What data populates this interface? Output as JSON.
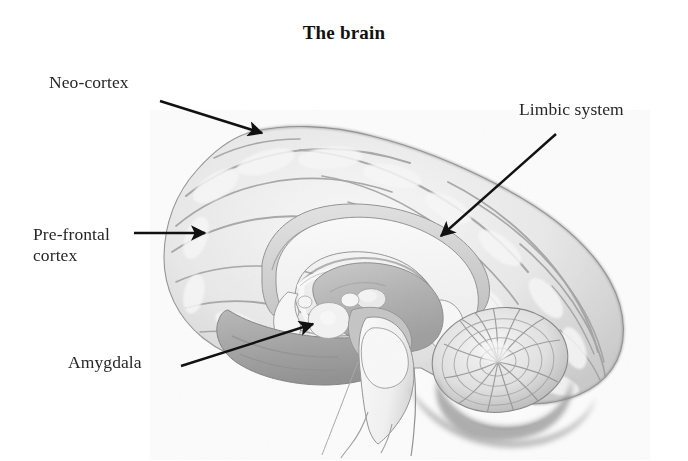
{
  "figure": {
    "title": "The brain",
    "background_color": "#ffffff",
    "ink_color": "#262626"
  },
  "annotations": [
    {
      "id": "neocortex",
      "label": "Neo-cortex",
      "label_pos": {
        "x": 49,
        "y": 72
      },
      "arrow": {
        "x1": 160,
        "y1": 101,
        "x2": 262,
        "y2": 133
      }
    },
    {
      "id": "limbic-system",
      "label": "Limbic system",
      "label_pos": {
        "x": 519,
        "y": 99
      },
      "arrow": {
        "x1": 556,
        "y1": 134,
        "x2": 441,
        "y2": 236
      }
    },
    {
      "id": "pre-frontal-cortex",
      "label": "Pre-frontal\ncortex",
      "label_pos": {
        "x": 33,
        "y": 224
      },
      "arrow": {
        "x1": 134,
        "y1": 233,
        "x2": 205,
        "y2": 233
      }
    },
    {
      "id": "amygdala",
      "label": "Amygdala",
      "label_pos": {
        "x": 68,
        "y": 352
      },
      "arrow": {
        "x1": 181,
        "y1": 366,
        "x2": 313,
        "y2": 324
      }
    }
  ],
  "illustration": {
    "type": "mid-sagittal brain section, pencil/halftone rendering",
    "regions": [
      {
        "name": "cerebral-cortex",
        "shade": "#e9e9e9"
      },
      {
        "name": "cingulate-gyrus",
        "shade": "#d9d9d9"
      },
      {
        "name": "corpus-callosum",
        "shade": "#fbfbfb"
      },
      {
        "name": "lateral-ventricle",
        "shade": "#fdfdfd"
      },
      {
        "name": "thalamus",
        "shade": "#b9b9b9"
      },
      {
        "name": "massa-intermedia",
        "shade": "#efefef"
      },
      {
        "name": "fornix",
        "shade": "#f8f8f8"
      },
      {
        "name": "temporal-lobe",
        "shade": "#a8a8a8"
      },
      {
        "name": "amygdala-body",
        "shade": "#f5f5f5"
      },
      {
        "name": "midbrain",
        "shade": "#c9c9c9"
      },
      {
        "name": "pons",
        "shade": "#f2f2f2"
      },
      {
        "name": "medulla-spinal-cord",
        "shade": "#fafafa"
      },
      {
        "name": "cerebellum",
        "shade": "#e3e3e3"
      }
    ]
  }
}
